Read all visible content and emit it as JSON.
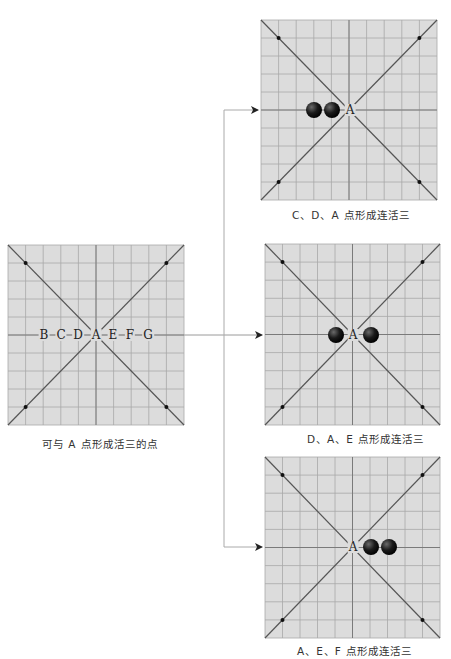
{
  "diagram": {
    "colors": {
      "board_bg": "#dcdcdc",
      "grid": "#a8a8a8",
      "axis": "#7a7a7a",
      "stone": "#111111",
      "star": "#111111",
      "connector": "#aaaaaa"
    },
    "source_board": {
      "caption": "可与 A 点形成活三的点",
      "row_labels": [
        "B",
        "C",
        "D",
        "A",
        "E",
        "F",
        "G"
      ],
      "separator": "·"
    },
    "result_boards": [
      {
        "caption": "C、D、A 点形成连活三",
        "center_label": "A",
        "stones": [
          "C",
          "D"
        ]
      },
      {
        "caption": "D、A、E 点形成连活三",
        "center_label": "A",
        "stones": [
          "D",
          "E"
        ]
      },
      {
        "caption": "A、E、F 点形成连活三",
        "center_label": "A",
        "stones": [
          "E",
          "F"
        ]
      }
    ]
  }
}
